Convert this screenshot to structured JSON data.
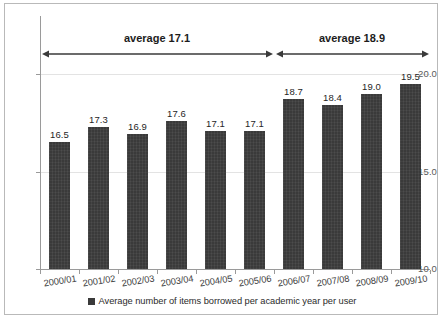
{
  "chart_data": {
    "type": "bar",
    "title": "",
    "xlabel": "",
    "ylabel": "",
    "categories": [
      "2000/01",
      "2001/02",
      "2002/03",
      "2003/04",
      "2004/05",
      "2005/06",
      "2006/07",
      "2007/08",
      "2008/09",
      "2009/10"
    ],
    "values": [
      16.5,
      17.3,
      16.9,
      17.6,
      17.1,
      17.1,
      18.7,
      18.4,
      19.0,
      19.5
    ],
    "value_labels": [
      "16.5",
      "17.3",
      "16.9",
      "17.6",
      "17.1",
      "17.1",
      "18.7",
      "18.4",
      "19.0",
      "19.5"
    ],
    "series": [
      {
        "name": "Average number of items borrowed per academic year per user",
        "values": [
          16.5,
          17.3,
          16.9,
          17.6,
          17.1,
          17.1,
          18.7,
          18.4,
          19.0,
          19.5
        ],
        "color": "#3a3a3a"
      }
    ],
    "ylim": [
      10.0,
      20.0
    ],
    "yticks": [
      10.0,
      15.0,
      20.0
    ],
    "ytick_labels": [
      "10.0",
      "15.0",
      "20.0"
    ],
    "grid": true,
    "legend_position": "bottom",
    "annotations": [
      {
        "label": "average 17.1",
        "span_categories": [
          "2000/01",
          "2005/06"
        ],
        "style": "double-headed-arrow"
      },
      {
        "label": "average 18.9",
        "span_categories": [
          "2006/07",
          "2009/10"
        ],
        "style": "double-headed-arrow"
      }
    ]
  },
  "legend": {
    "entries": [
      {
        "label": "Average number of items borrowed per academic year per user",
        "color": "#3a3a3a"
      }
    ]
  },
  "colors": {
    "bar": "#3a3a3a",
    "axis": "#9a9a9a",
    "grid": "#e3e3e3",
    "frame": "#b9b9b9",
    "background": "#ffffff"
  }
}
